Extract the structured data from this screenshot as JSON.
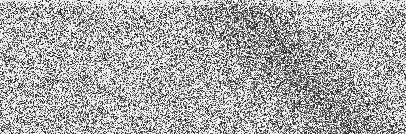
{
  "image": {
    "width": 406,
    "height": 134,
    "description": "Grayscale speckle/noise texture with a faint darker diagonal band toward the upper-right and lower-right",
    "colors": {
      "light": "#f4f4f4",
      "dark": "#1a1a1a"
    },
    "noise": {
      "base_density": 0.42,
      "top_edge_lighten": 0.25,
      "band": {
        "from": [
          230,
          0
        ],
        "to": [
          350,
          134
        ],
        "width": 55,
        "extra_density": 0.25
      },
      "seed": 1337
    }
  }
}
